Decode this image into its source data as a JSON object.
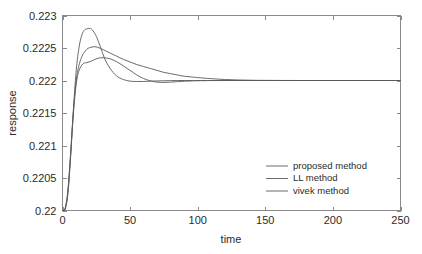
{
  "chart_data": {
    "type": "line",
    "title": "",
    "xlabel": "time",
    "ylabel": "response",
    "xlim": [
      0,
      250
    ],
    "ylim": [
      0.22,
      0.223
    ],
    "xticks": [
      0,
      50,
      100,
      150,
      200,
      250
    ],
    "yticks": [
      0.22,
      0.2205,
      0.221,
      0.2215,
      0.222,
      0.2225,
      0.223
    ],
    "xtick_labels": [
      "0",
      "50",
      "100",
      "150",
      "200",
      "250"
    ],
    "ytick_labels": [
      "0.22",
      "0.2205",
      "0.221",
      "0.2215",
      "0.222",
      "0.2225",
      "0.223"
    ],
    "grid": false,
    "legend_position": "center-right-lower",
    "steady_state": 0.222,
    "series": [
      {
        "name": "proposed method",
        "color": "#5a5a5a",
        "x": [
          0,
          2,
          4,
          6,
          8,
          10,
          12,
          14,
          16,
          18,
          20,
          24,
          28,
          32,
          36,
          40,
          45,
          50,
          55,
          60,
          65,
          70,
          75,
          80,
          85,
          90,
          95,
          100,
          110,
          120,
          130,
          140,
          150,
          175,
          200,
          225,
          250
        ],
        "y": [
          0.22,
          0.22004,
          0.22032,
          0.22088,
          0.22152,
          0.22198,
          0.22222,
          0.22235,
          0.22243,
          0.22248,
          0.222505,
          0.22252,
          0.222495,
          0.222455,
          0.222415,
          0.222375,
          0.222325,
          0.222285,
          0.222245,
          0.222215,
          0.222185,
          0.222155,
          0.222125,
          0.222105,
          0.222085,
          0.222065,
          0.222055,
          0.222045,
          0.222028,
          0.222015,
          0.222008,
          0.222004,
          0.222002,
          0.222,
          0.222,
          0.222,
          0.222
        ]
      },
      {
        "name": "LL method",
        "color": "#5a5a5a",
        "x": [
          0,
          2,
          4,
          6,
          8,
          10,
          12,
          14,
          16,
          18,
          20,
          22,
          25,
          28,
          31,
          35,
          40,
          45,
          50,
          55,
          60,
          65,
          70,
          75,
          80,
          85,
          90,
          95,
          100,
          110,
          120,
          130,
          140,
          150,
          175,
          200,
          225,
          250
        ],
        "y": [
          0.22,
          0.22002,
          0.22026,
          0.22082,
          0.22152,
          0.22212,
          0.22248,
          0.22268,
          0.22277,
          0.222795,
          0.2228,
          0.22278,
          0.22268,
          0.22252,
          0.222345,
          0.22219,
          0.22207,
          0.222015,
          0.22199,
          0.221985,
          0.221985,
          0.22199,
          0.221993,
          0.221996,
          0.221998,
          0.222,
          0.222,
          0.222,
          0.222,
          0.222,
          0.222,
          0.222,
          0.222,
          0.222,
          0.222,
          0.222,
          0.222,
          0.222
        ]
      },
      {
        "name": "vivek method",
        "color": "#5a5a5a",
        "x": [
          0,
          2,
          4,
          6,
          8,
          10,
          12,
          15,
          18,
          21,
          24,
          27,
          30,
          35,
          40,
          45,
          50,
          55,
          60,
          65,
          70,
          75,
          80,
          85,
          90,
          95,
          100,
          110,
          120,
          130,
          140,
          150,
          175,
          200,
          225,
          250
        ],
        "y": [
          0.22,
          0.22003,
          0.22028,
          0.22086,
          0.22148,
          0.22192,
          0.22214,
          0.222255,
          0.222275,
          0.222295,
          0.222325,
          0.222345,
          0.22235,
          0.222335,
          0.22229,
          0.222225,
          0.222155,
          0.222085,
          0.22203,
          0.221995,
          0.221975,
          0.22197,
          0.221975,
          0.221982,
          0.221988,
          0.221993,
          0.221996,
          0.221999,
          0.222,
          0.222,
          0.222,
          0.222,
          0.222,
          0.222,
          0.222,
          0.222
        ]
      }
    ]
  },
  "legend": {
    "items": [
      {
        "label": "proposed method"
      },
      {
        "label": "LL method"
      },
      {
        "label": "vivek method"
      }
    ]
  },
  "axes": {
    "x_title": "time",
    "y_title": "response"
  },
  "colors": {
    "background": "#ffffff",
    "axis": "#8a8a8a",
    "line": "#5a5a5a",
    "text": "#2b2b2b"
  }
}
